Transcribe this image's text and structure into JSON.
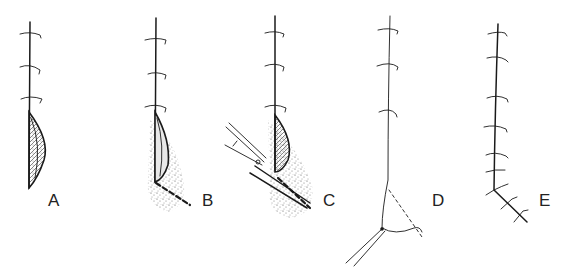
{
  "figure": {
    "type": "surgical technique illustration",
    "panels": [
      {
        "id": "A",
        "label": "A",
        "depicts": "running suture line with knot stitches above a lenticular incision/fold with internal hatching"
      },
      {
        "id": "B",
        "label": "B",
        "depicts": "suture line with lenticular fold and surrounding stippled tissue area, dashed cut line extending down-right"
      },
      {
        "id": "C",
        "label": "C",
        "depicts": "scissors cutting along the dashed line through stippled tissue at base of fold"
      },
      {
        "id": "D",
        "label": "D",
        "depicts": "suture line after excision with dashed triangular flap and thread ends below"
      },
      {
        "id": "E",
        "label": "E",
        "depicts": "completed suture line with multiple stitches turning at an angle toward lower right"
      }
    ]
  },
  "colors": {
    "background": "#ffffff",
    "ink": "#1a1a1a",
    "stipple": "#555555"
  }
}
